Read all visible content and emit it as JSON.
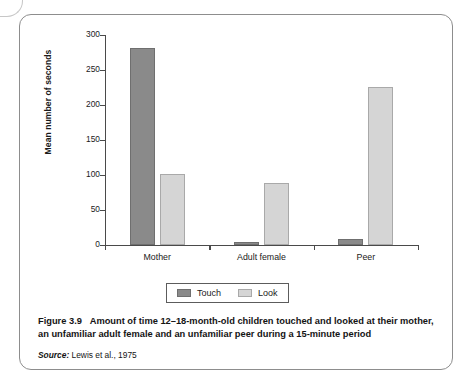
{
  "figure": {
    "caption_label": "Figure 3.9",
    "caption_body": "Amount of time 12–18-month-old children touched and looked at their mother, an unfamiliar adult female and an unfamiliar peer during a 15-minute period",
    "source_word": "Source:",
    "source_text": "Lewis et al., 1975"
  },
  "legend": {
    "items": [
      {
        "label": "Touch",
        "color": "#8a8a8a"
      },
      {
        "label": "Look",
        "color": "#d5d5d5"
      }
    ]
  },
  "chart_data": {
    "type": "bar",
    "title": "",
    "xlabel": "",
    "ylabel": "Mean number of seconds",
    "categories": [
      "Mother",
      "Adult female",
      "Peer"
    ],
    "series": [
      {
        "name": "Touch",
        "color": "#8a8a8a",
        "values": [
          281,
          4,
          8
        ]
      },
      {
        "name": "Look",
        "color": "#d5d5d5",
        "values": [
          101,
          89,
          226
        ]
      }
    ],
    "ylim": [
      0,
      300
    ],
    "yticks": [
      0,
      50,
      100,
      150,
      200,
      250,
      300
    ],
    "ytick_labels": [
      "0",
      "50",
      "100",
      "150",
      "200",
      "250",
      "300"
    ],
    "grid": false,
    "legend_position": "bottom"
  }
}
